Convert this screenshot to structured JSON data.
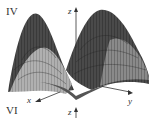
{
  "figure": {
    "panels": [
      {
        "label": "IV",
        "axes": {
          "z": "z",
          "x": "x",
          "y": "y"
        },
        "surface": "3D wireframe surface with two peaks and a central saddle/valley"
      },
      {
        "label": "VI",
        "axes": {
          "z": "z"
        }
      }
    ],
    "colors": {
      "surface_dark": "#3a3a3a",
      "surface_mid": "#7a7a7a",
      "surface_light": "#a8a8a8",
      "axis": "#333333"
    }
  }
}
